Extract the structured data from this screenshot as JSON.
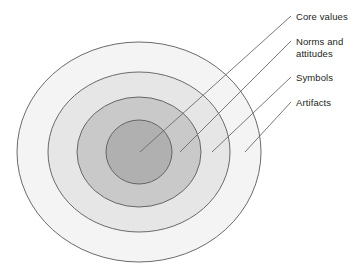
{
  "diagram": {
    "type": "concentric-ellipse-onion",
    "title_visible": false,
    "background_color": "#ffffff",
    "stroke_color": "#5a5a5a",
    "leader_line_color": "#6b6b6b",
    "text_color": "#231f20",
    "center": {
      "x": 139,
      "y": 152
    },
    "layers": [
      {
        "id": "artifacts",
        "label": "Artifacts",
        "level": 4,
        "position": "outermost",
        "fill": "#f4f4f4",
        "rx": 122,
        "ry": 110
      },
      {
        "id": "symbols",
        "label": "Symbols",
        "level": 3,
        "position": "outer-middle",
        "fill": "#e6e6e6",
        "rx": 91,
        "ry": 80
      },
      {
        "id": "norms-and-attitudes",
        "label": "Norms and\nattitudes",
        "level": 2,
        "position": "inner-middle",
        "fill": "#c9c9c9",
        "rx": 62,
        "ry": 55
      },
      {
        "id": "core-values",
        "label": "Core values",
        "level": 1,
        "position": "innermost",
        "fill": "#b0b0b0",
        "rx": 33,
        "ry": 32
      }
    ],
    "leader_lines": [
      {
        "id": "core-values-leader",
        "target_layer": "core-values",
        "tip_x": 140,
        "tip_y": 152,
        "end_x": 291,
        "end_y": 16
      },
      {
        "id": "norms-leader",
        "target_layer": "norms-and-attitudes",
        "tip_x": 180,
        "tip_y": 152,
        "end_x": 291,
        "end_y": 41
      },
      {
        "id": "symbols-leader",
        "target_layer": "symbols",
        "tip_x": 212,
        "tip_y": 152,
        "end_x": 291,
        "end_y": 77
      },
      {
        "id": "artifacts-leader",
        "target_layer": "artifacts",
        "tip_x": 245,
        "tip_y": 152,
        "end_x": 291,
        "end_y": 102
      }
    ]
  }
}
